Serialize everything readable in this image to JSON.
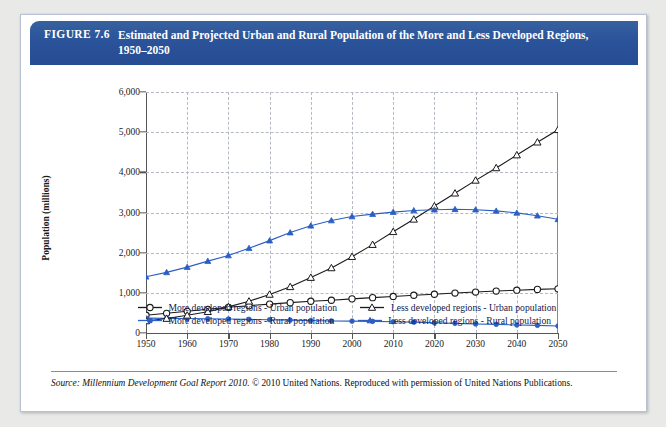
{
  "figure": {
    "label": "FIGURE 7.6",
    "title": "Estimated and Projected Urban and Rural Population of the More and Less Developed Regions, 1950–2050",
    "header_color": "#2b539a"
  },
  "source": {
    "italic_part": "Source: Millennium Development Goal Report 2010.",
    "rest": " © 2010 United Nations. Reproduced with permission of United Nations Publications."
  },
  "legend": {
    "items": [
      {
        "label": "More developed regions - Urban population",
        "color": "#1a1a1a",
        "marker": "open-circle"
      },
      {
        "label": "More developed regions - Rural population",
        "color": "#2b5fc4",
        "marker": "filled-circle"
      },
      {
        "label": "Less developed regions - Urban population",
        "color": "#1a1a1a",
        "marker": "open-triangle"
      },
      {
        "label": "Less developed regions - Rural population",
        "color": "#2b5fc4",
        "marker": "filled-triangle"
      }
    ]
  },
  "chart_data": {
    "type": "line",
    "title": "Estimated and Projected Urban and Rural Population of the More and Less Developed Regions, 1950–2050",
    "xlabel": "",
    "ylabel": "Population (millions)",
    "xlim": [
      1950,
      2050
    ],
    "ylim": [
      0,
      6000
    ],
    "ytick_labels": [
      "0",
      "1,000",
      "2,000",
      "3,000",
      "4,000",
      "5,000",
      "6,000"
    ],
    "yticks": [
      0,
      1000,
      2000,
      3000,
      4000,
      5000,
      6000
    ],
    "xtick_labels": [
      "1950",
      "1960",
      "1970",
      "1980",
      "1990",
      "2000",
      "2010",
      "2020",
      "2030",
      "2040",
      "2050"
    ],
    "xticks": [
      1950,
      1960,
      1970,
      1980,
      1990,
      2000,
      2010,
      2020,
      2030,
      2040,
      2050
    ],
    "grid": true,
    "legend_position": "below",
    "x": [
      1950,
      1955,
      1960,
      1965,
      1970,
      1975,
      1980,
      1985,
      1990,
      1995,
      2000,
      2005,
      2010,
      2015,
      2020,
      2025,
      2030,
      2035,
      2040,
      2045,
      2050
    ],
    "series": [
      {
        "name": "More developed regions - Urban population",
        "color": "#1a1a1a",
        "marker": "open-circle",
        "values": [
          442,
          490,
          540,
          590,
          640,
          680,
          720,
          755,
          790,
          815,
          850,
          880,
          910,
          940,
          965,
          995,
          1020,
          1045,
          1065,
          1085,
          1100
        ]
      },
      {
        "name": "More developed regions - Rural population",
        "color": "#2b5fc4",
        "marker": "filled-circle",
        "values": [
          370,
          365,
          360,
          355,
          350,
          340,
          330,
          320,
          310,
          300,
          295,
          290,
          280,
          270,
          255,
          240,
          225,
          215,
          200,
          190,
          175
        ]
      },
      {
        "name": "Less developed regions - Urban population",
        "color": "#1a1a1a",
        "marker": "open-triangle",
        "values": [
          300,
          360,
          440,
          530,
          650,
          790,
          960,
          1150,
          1380,
          1620,
          1900,
          2200,
          2520,
          2830,
          3160,
          3480,
          3800,
          4110,
          4430,
          4750,
          5060
        ]
      },
      {
        "name": "Less developed regions - Rural population",
        "color": "#2b5fc4",
        "marker": "filled-triangle",
        "values": [
          1400,
          1510,
          1640,
          1790,
          1930,
          2110,
          2300,
          2500,
          2670,
          2800,
          2900,
          2960,
          3010,
          3050,
          3070,
          3080,
          3070,
          3040,
          2990,
          2920,
          2830
        ]
      }
    ]
  }
}
